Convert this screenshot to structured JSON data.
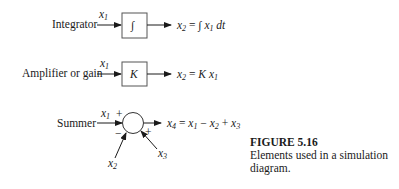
{
  "figure": {
    "number": "FIGURE 5.16",
    "caption_line1": "Elements used in a simulation",
    "caption_line2": "diagram."
  },
  "elements": [
    {
      "name": "Integrator",
      "label": "Integrator",
      "input": "x1",
      "block_symbol": "∫",
      "output_equation": "x2 = ∫ x1 dt"
    },
    {
      "name": "Amplifier or gain",
      "label": "Amplifier or gain",
      "input": "x1",
      "block_symbol": "K",
      "output_equation": "x2 = K x1"
    },
    {
      "name": "Summer",
      "label": "Summer",
      "inputs": [
        {
          "var": "x1",
          "sign": "+"
        },
        {
          "var": "x2",
          "sign": "−"
        },
        {
          "var": "x3",
          "sign": "+"
        }
      ],
      "output_equation": "x4 = x1 − x2 + x3"
    }
  ],
  "labels": {
    "integrator": "Integrator",
    "amplifier": "Amplifier or gain",
    "summer": "Summer",
    "integral_sign": "∫",
    "gain_k": "K",
    "plus": "+",
    "minus": "−"
  },
  "colors": {
    "ink": "#1a1a1a",
    "box_stroke": "#555555",
    "background": "#ffffff"
  }
}
